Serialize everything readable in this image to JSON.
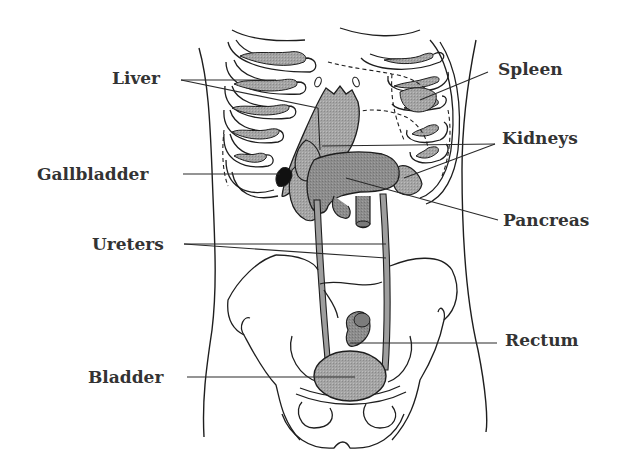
{
  "diagram": {
    "colors": {
      "organ_fill": "#9a9a9a",
      "organ_fill_light": "#b8b8b8",
      "outline": "#1e1e1e",
      "label_text": "#333333",
      "background": "#ffffff"
    },
    "labels": [
      {
        "id": "liver",
        "text": "Liver",
        "side": "left"
      },
      {
        "id": "spleen",
        "text": "Spleen",
        "side": "right"
      },
      {
        "id": "gallbladder",
        "text": "Gallbladder",
        "side": "left"
      },
      {
        "id": "kidneys",
        "text": "Kidneys",
        "side": "right"
      },
      {
        "id": "pancreas",
        "text": "Pancreas",
        "side": "right"
      },
      {
        "id": "ureters",
        "text": "Ureters",
        "side": "left"
      },
      {
        "id": "rectum",
        "text": "Rectum",
        "side": "right"
      },
      {
        "id": "bladder",
        "text": "Bladder",
        "side": "left"
      }
    ]
  }
}
